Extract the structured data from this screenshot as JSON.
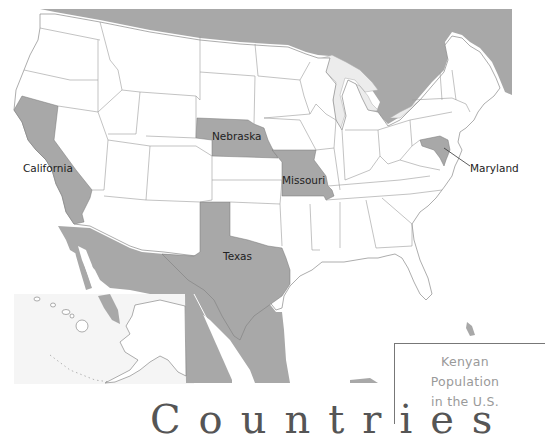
{
  "map": {
    "subject": "Kenyan Population in the U.S.",
    "highlight_color": "#a8a8a8",
    "land_color": "#ffffff",
    "border_color": "#8a8a8a",
    "foreign_land_color": "#a8a8a8",
    "lake_color": "#e8e8e8",
    "highlighted_states": [
      "California",
      "Nebraska",
      "Missouri",
      "Texas",
      "Maryland"
    ]
  },
  "labels": {
    "california": "California",
    "nebraska": "Nebraska",
    "missouri": "Missouri",
    "texas": "Texas",
    "maryland": "Maryland"
  },
  "legend": {
    "line1": "Kenyan",
    "line2": "Population",
    "line3": "in the U.S."
  },
  "bottom_title": "Countries"
}
